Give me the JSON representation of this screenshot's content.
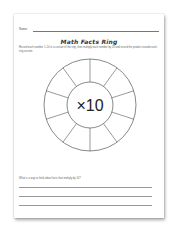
{
  "worksheet": {
    "name_label": "Name:",
    "title": "Math Facts Ring",
    "instructions": "Record each number 1–10 in a section of the ring, then multiply each number by 10 and record the product outside each ring section.",
    "center_label": "×10",
    "ring_sections": 10,
    "question": "What is a way to think about facts that multiply by 10?",
    "answer_lines": 3
  }
}
